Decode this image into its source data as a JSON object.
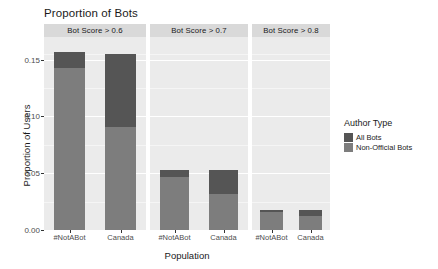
{
  "chart_data": {
    "type": "bar",
    "subtype": "stacked-bar-faceted",
    "title": "Proportion of Bots",
    "xlabel": "Population",
    "ylabel": "Proportion of Users",
    "ylim": [
      0,
      0.17
    ],
    "yticks": [
      0.0,
      0.05,
      0.1,
      0.15
    ],
    "ytick_labels": [
      "0.00",
      "0.05",
      "0.10",
      "0.15"
    ],
    "grid": true,
    "legend_position": "right",
    "legend_title": "Author Type",
    "categories": [
      "#NotABot",
      "Canada"
    ],
    "facet_variable": "Bot Score",
    "facets": [
      {
        "label": "Bot Score > 0.6",
        "categories": [
          "#NotABot",
          "Canada"
        ],
        "series": [
          {
            "name": "All Bots",
            "values": [
              0.157,
              0.155
            ]
          },
          {
            "name": "Non-Official Bots",
            "values": [
              0.143,
              0.091
            ]
          }
        ]
      },
      {
        "label": "Bot Score > 0.7",
        "categories": [
          "#NotABot",
          "Canada"
        ],
        "series": [
          {
            "name": "All Bots",
            "values": [
              0.0525,
              0.0525
            ]
          },
          {
            "name": "Non-Official Bots",
            "values": [
              0.0465,
              0.0315
            ]
          }
        ]
      },
      {
        "label": "Bot Score > 0.8",
        "categories": [
          "#NotABot",
          "Canada"
        ],
        "series": [
          {
            "name": "All Bots",
            "values": [
              0.0175,
              0.018
            ]
          },
          {
            "name": "Non-Official Bots",
            "values": [
              0.0155,
              0.012
            ]
          }
        ]
      }
    ],
    "series_colors": {
      "All Bots": "#555555",
      "Non-Official Bots": "#7d7d7d"
    },
    "panel_background": "#ebebeb",
    "strip_background": "#d9d9d9"
  },
  "legend": {
    "title": "Author Type",
    "items": [
      {
        "label": "All Bots",
        "color": "#555555"
      },
      {
        "label": "Non-Official Bots",
        "color": "#7d7d7d"
      }
    ]
  }
}
